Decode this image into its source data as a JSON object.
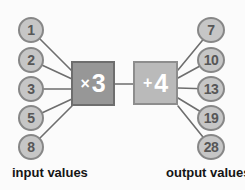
{
  "inputs": {
    "label": "input values",
    "values": [
      "1",
      "2",
      "3",
      "5",
      "8"
    ]
  },
  "outputs": {
    "label": "output values",
    "values": [
      "7",
      "10",
      "13",
      "19",
      "28"
    ]
  },
  "machine": {
    "multiply": {
      "symbol": "×",
      "operand": "3"
    },
    "add": {
      "symbol": "+",
      "operand": "4"
    }
  },
  "colors": {
    "background": "#fbfbfb",
    "circle_fill": "#c6c6c6",
    "circle_border": "#878787",
    "circle_text": "#575757",
    "multiply_box_fill": "#979797",
    "multiply_box_border": "#6e6e6e",
    "add_box_fill": "#bababa",
    "add_box_border": "#8d8d8d",
    "box_text": "#ffffff",
    "line": "#6e6e6e",
    "label_text": "#151515"
  }
}
